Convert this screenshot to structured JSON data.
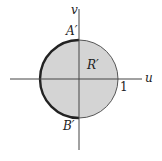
{
  "diagram": {
    "type": "region-in-uv-plane",
    "axes": {
      "horizontal_label": "u",
      "vertical_label": "v"
    },
    "region": {
      "label": "R′",
      "shape": "unit disk",
      "fill_color": "#d4d4d4",
      "boundary_color": "#333333"
    },
    "points": {
      "top": "A′",
      "bottom": "B′"
    },
    "tick_label": "1",
    "highlighted_boundary": "left semicircle from A′ to B′ (thick)"
  }
}
